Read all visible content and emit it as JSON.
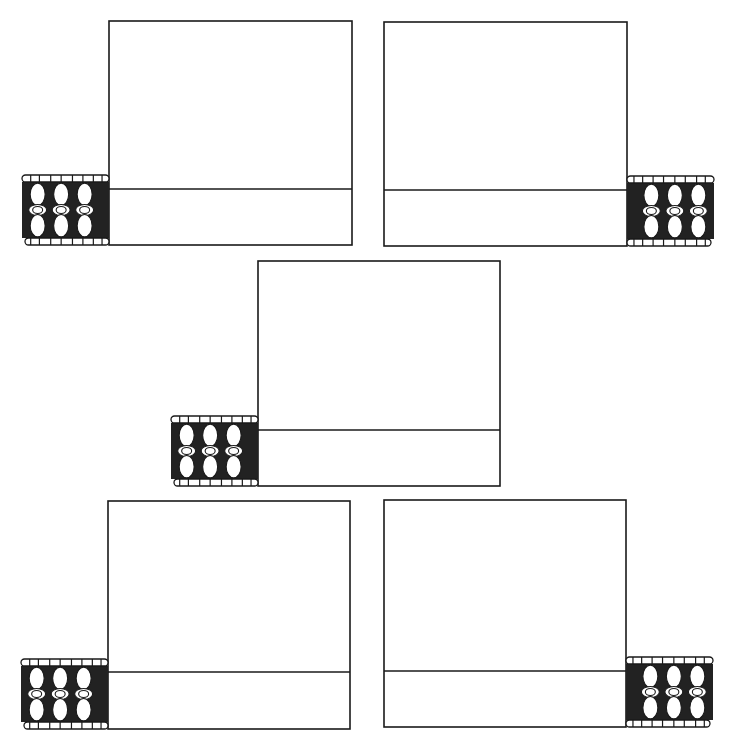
{
  "diagram": {
    "type": "line-drawing",
    "colors": {
      "stroke": "#1a1a1a",
      "fill": "#ffffff",
      "band_fill": "#222222"
    },
    "panels": [
      {
        "id": "panel-top-left",
        "box": [
          109,
          21,
          243,
          224
        ],
        "divider_y": 168,
        "band_side": "left"
      },
      {
        "id": "panel-top-right",
        "box": [
          384,
          22,
          243,
          224
        ],
        "divider_y": 168,
        "band_side": "right"
      },
      {
        "id": "panel-middle",
        "box": [
          258,
          261,
          242,
          225
        ],
        "divider_y": 169,
        "band_side": "left"
      },
      {
        "id": "panel-bottom-left",
        "box": [
          108,
          501,
          242,
          228
        ],
        "divider_y": 171,
        "band_side": "left"
      },
      {
        "id": "panel-bottom-right",
        "box": [
          384,
          500,
          242,
          227
        ],
        "divider_y": 171,
        "band_side": "right"
      }
    ],
    "band": {
      "width": 87,
      "height": 70,
      "bead_columns": 3
    }
  }
}
